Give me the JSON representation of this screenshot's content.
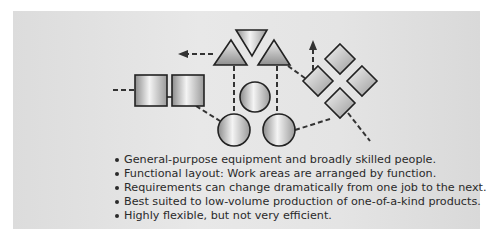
{
  "figure": {
    "type": "process-layout-diagram",
    "title": "",
    "shapes": {
      "squares": 2,
      "triangles": 3,
      "circles": 3,
      "diamonds": 4
    },
    "colors": {
      "panel": "#e2e2e2",
      "shape_fill_light": "#f4f4f4",
      "shape_fill_dark": "#8c8c8c",
      "stroke": "#222222",
      "text": "#2a2a2a"
    }
  },
  "bullets": [
    "General-purpose equipment and broadly skilled people.",
    "Functional layout: Work areas are arranged by function.",
    "Requirements can change dramatically from one job to the next.",
    "Best suited to low-volume production of one-of-a-kind products.",
    "Highly flexible, but not very efficient."
  ]
}
